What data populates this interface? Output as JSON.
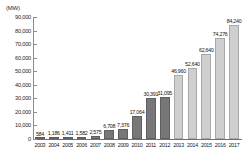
{
  "chart_data": {
    "type": "bar",
    "title": "",
    "subtitle": "",
    "unit_caption": "(MW)",
    "xlabel": "",
    "ylabel": "",
    "ylim": [
      0,
      90000
    ],
    "ytick_step": 10000,
    "grid": false,
    "legend": "none",
    "categories": [
      "2003",
      "2004",
      "2005",
      "2006",
      "2007",
      "2008",
      "2009",
      "2010",
      "2011",
      "2012",
      "2013",
      "2014",
      "2015",
      "2016",
      "2017"
    ],
    "values": [
      584,
      1186,
      1411,
      1582,
      2575,
      6708,
      7376,
      17064,
      30391,
      31095,
      46960,
      52640,
      62640,
      74276,
      84240
    ],
    "value_labels": [
      "584",
      "1,186",
      "1,411",
      "1,582",
      "2,575",
      "6,708",
      "7,376",
      "17,064",
      "30,391",
      "31,095",
      "46,960",
      "52,640",
      "62,640",
      "74,276",
      "84,240"
    ],
    "ytick_labels": [
      "0",
      "10,000",
      "20,000",
      "30,000",
      "40,000",
      "50,000",
      "60,000",
      "70,000",
      "80,000",
      "90,000"
    ],
    "ytick_values": [
      0,
      10000,
      20000,
      30000,
      40000,
      50000,
      60000,
      70000,
      80000,
      90000
    ],
    "bar_colors": [
      "#77777a",
      "#77777a",
      "#77777a",
      "#77777a",
      "#77777a",
      "#77777a",
      "#77777a",
      "#77777a",
      "#77777a",
      "#77777a",
      "#cfcfcf",
      "#cfcfcf",
      "#cfcfcf",
      "#cfcfcf",
      "#cfcfcf"
    ],
    "color_dark": "#77777a",
    "color_light": "#cfcfcf",
    "axis_color": "#8d8d8d",
    "text_color": "#1a1a1a"
  }
}
